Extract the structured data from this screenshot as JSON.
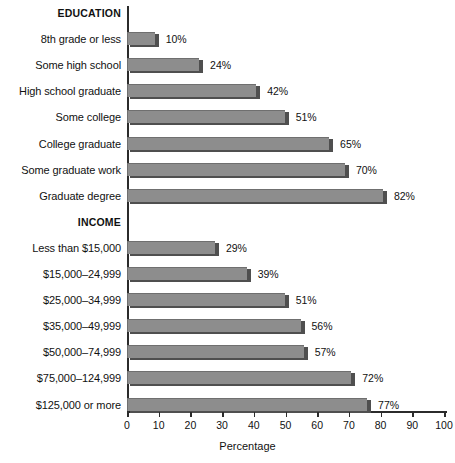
{
  "chart_data": {
    "type": "bar",
    "orientation": "horizontal",
    "title": "",
    "xlabel": "Percentage",
    "ylabel": "",
    "xlim": [
      0,
      100
    ],
    "xticks": [
      0,
      10,
      20,
      30,
      40,
      50,
      60,
      70,
      80,
      90,
      100
    ],
    "xtick_labels": [
      "0",
      "10",
      "20",
      "30",
      "40",
      "50",
      "60",
      "70",
      "80",
      "90",
      "100"
    ],
    "grid": false,
    "legend": "none",
    "value_suffix": "%",
    "bar_color": "#8d8d8d",
    "bar_shadow_color": "#4f4f4f",
    "axis_color": "#2b2b2b",
    "groups": [
      {
        "heading": "EDUCATION",
        "categories": [
          "8th grade or less",
          "Some high school",
          "High school graduate",
          "Some college",
          "College graduate",
          "Some graduate work",
          "Graduate degree"
        ],
        "values": [
          10,
          24,
          42,
          51,
          65,
          70,
          82
        ],
        "value_labels": [
          "10%",
          "24%",
          "42%",
          "51%",
          "65%",
          "70%",
          "82%"
        ]
      },
      {
        "heading": "INCOME",
        "categories": [
          "Less than $15,000",
          "$15,000–24,999",
          "$25,000–34,999",
          "$35,000–49,999",
          "$50,000–74,999",
          "$75,000–124,999",
          "$125,000 or more"
        ],
        "values": [
          29,
          39,
          51,
          56,
          57,
          72,
          77
        ],
        "value_labels": [
          "29%",
          "39%",
          "51%",
          "56%",
          "57%",
          "72%",
          "77%"
        ]
      }
    ]
  }
}
